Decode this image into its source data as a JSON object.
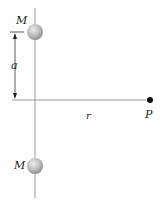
{
  "diagram": {
    "labels": {
      "top_mass": "M",
      "bottom_mass": "M",
      "distance_a": "a",
      "distance_r": "r",
      "point": "P"
    },
    "colors": {
      "line": "#9a9a9a",
      "sphere": "#bdbdbd",
      "point": "#111111",
      "text": "#1a1a1a"
    }
  }
}
